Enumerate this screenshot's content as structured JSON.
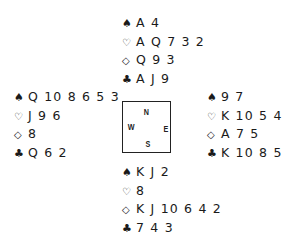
{
  "hands": {
    "north": {
      "spades": "A 4",
      "hearts": "A Q 7 3 2",
      "diamonds": "Q 9 3",
      "clubs": "A J 9"
    },
    "west": {
      "spades": "Q 10 8 6 5 3",
      "hearts": "J 9 6",
      "diamonds": "8",
      "clubs": "Q 6 2"
    },
    "east": {
      "spades": "9 7",
      "hearts": "K 10 5 4",
      "diamonds": "A 7 5",
      "clubs": "K 10 8 5"
    },
    "south": {
      "spades": "K J 2",
      "hearts": "8",
      "diamonds": "K J 10 6 4 2",
      "clubs": "7 4 3"
    }
  },
  "symbols": {
    "spades": "♠",
    "hearts": "♡",
    "diamonds": "◇",
    "clubs": "♣"
  },
  "compass": {
    "north": "N",
    "south": "S",
    "east": "E",
    "west": "W"
  }
}
